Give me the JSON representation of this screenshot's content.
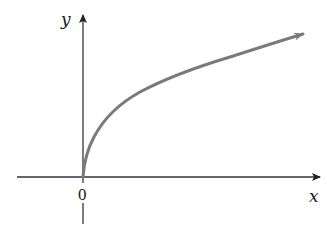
{
  "figure": {
    "x_axis_label": "x",
    "y_axis_label": "y",
    "origin_label": "0"
  },
  "colors": {
    "axis": "#222222",
    "curve": "#7a7a7a",
    "background": "#ffffff"
  },
  "curve_points": [
    [
      83,
      177
    ],
    [
      88,
      150
    ],
    [
      98,
      130
    ],
    [
      120,
      100
    ],
    [
      163,
      82
    ],
    [
      200,
      66
    ],
    [
      250,
      50
    ],
    [
      300,
      34
    ]
  ]
}
